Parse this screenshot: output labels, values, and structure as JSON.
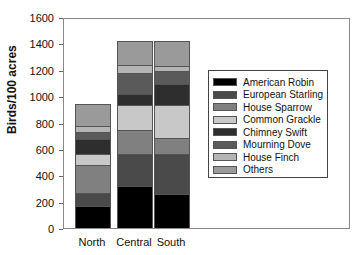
{
  "chart_data": {
    "type": "bar",
    "stacked": true,
    "title": "",
    "xlabel": "",
    "ylabel": "Birds/100 acres",
    "ylim": [
      0,
      1600
    ],
    "yticks": [
      0,
      200,
      400,
      600,
      800,
      1000,
      1200,
      1400,
      1600
    ],
    "grid": false,
    "legend_position": "right-inside",
    "categories": [
      "North",
      "Central",
      "South"
    ],
    "series": [
      {
        "name": "American Robin",
        "color": "#000000",
        "values": [
          168,
          320,
          259
        ]
      },
      {
        "name": "European Starling",
        "color": "#4a4a4a",
        "values": [
          100,
          244,
          305
        ]
      },
      {
        "name": "House Sparrow",
        "color": "#808080",
        "values": [
          213,
          183,
          122
        ]
      },
      {
        "name": "Common Grackle",
        "color": "#c8c8c8",
        "values": [
          84,
          183,
          244
        ]
      },
      {
        "name": "Chimney Swift",
        "color": "#2e2e2e",
        "values": [
          107,
          84,
          160
        ]
      },
      {
        "name": "Mourning Dove",
        "color": "#5a5a5a",
        "values": [
          53,
          160,
          99
        ]
      },
      {
        "name": "House Finch",
        "color": "#b4b4b4",
        "values": [
          46,
          61,
          38
        ]
      },
      {
        "name": "Others",
        "color": "#9a9a9a",
        "values": [
          168,
          183,
          190
        ]
      }
    ]
  }
}
